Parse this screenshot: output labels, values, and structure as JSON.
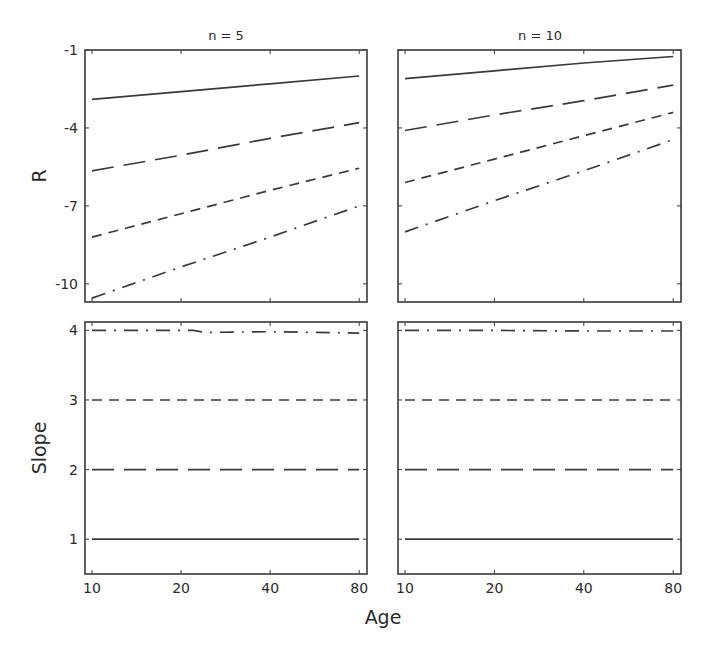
{
  "figure": {
    "xlabel": "Age",
    "row_labels": [
      "R",
      "Slope"
    ],
    "column_titles": [
      "n = 5",
      "n = 10"
    ]
  },
  "chart_data": [
    {
      "type": "line",
      "panel": "top-left",
      "title": "n = 5",
      "xlabel": "",
      "ylabel": "R",
      "x_scale": "log",
      "x": [
        10,
        20,
        40,
        80
      ],
      "xticks": [
        10,
        20,
        40,
        80
      ],
      "xlim": [
        9.47,
        85
      ],
      "yticks": [
        -1,
        -4,
        -7,
        -10
      ],
      "ylim": [
        -10.7,
        -1
      ],
      "grid": false,
      "series": [
        {
          "name": "slope 1",
          "style": "solid",
          "values": [
            -2.9,
            -2.6,
            -2.3,
            -2.0
          ]
        },
        {
          "name": "slope 2",
          "style": "long-dash",
          "values": [
            -5.65,
            -5.05,
            -4.4,
            -3.8
          ]
        },
        {
          "name": "slope 3",
          "style": "short-dash",
          "values": [
            -8.2,
            -7.3,
            -6.4,
            -5.55
          ]
        },
        {
          "name": "slope 4",
          "style": "dash-dot",
          "values": [
            -10.55,
            -9.35,
            -8.2,
            -7.0
          ]
        }
      ]
    },
    {
      "type": "line",
      "panel": "top-right",
      "title": "n = 10",
      "xlabel": "",
      "ylabel": "",
      "x_scale": "log",
      "x": [
        10,
        20,
        40,
        80
      ],
      "xticks": [
        10,
        20,
        40,
        80
      ],
      "xlim": [
        9.47,
        85
      ],
      "yticks": [
        -1,
        -4,
        -7,
        -10
      ],
      "ylim": [
        -10.7,
        -1
      ],
      "grid": false,
      "series": [
        {
          "name": "slope 1",
          "style": "solid",
          "values": [
            -2.1,
            -1.8,
            -1.5,
            -1.25
          ]
        },
        {
          "name": "slope 2",
          "style": "long-dash",
          "values": [
            -4.1,
            -3.5,
            -2.95,
            -2.35
          ]
        },
        {
          "name": "slope 3",
          "style": "short-dash",
          "values": [
            -6.1,
            -5.2,
            -4.3,
            -3.4
          ]
        },
        {
          "name": "slope 4",
          "style": "dash-dot",
          "values": [
            -8.0,
            -6.8,
            -5.65,
            -4.45
          ]
        }
      ]
    },
    {
      "type": "line",
      "panel": "bottom-left",
      "title": "",
      "xlabel": "Age",
      "ylabel": "Slope",
      "x_scale": "log",
      "x": [
        10,
        20,
        22,
        24,
        40,
        80
      ],
      "xticks": [
        10,
        20,
        40,
        80
      ],
      "xlim": [
        9.47,
        85
      ],
      "yticks": [
        1,
        2,
        3,
        4
      ],
      "ylim": [
        0.5,
        4.12
      ],
      "grid": false,
      "series": [
        {
          "name": "slope 1",
          "style": "solid",
          "values": [
            1.0,
            1.0,
            1.0,
            1.0,
            1.0,
            1.0
          ]
        },
        {
          "name": "slope 2",
          "style": "long-dash",
          "values": [
            2.0,
            2.0,
            2.0,
            2.0,
            2.0,
            2.0
          ]
        },
        {
          "name": "slope 3",
          "style": "short-dash",
          "values": [
            3.0,
            3.0,
            3.0,
            3.0,
            3.0,
            3.0
          ]
        },
        {
          "name": "slope 4",
          "style": "dash-dot",
          "values": [
            4.0,
            4.0,
            4.0,
            3.97,
            3.98,
            3.96
          ]
        }
      ]
    },
    {
      "type": "line",
      "panel": "bottom-right",
      "title": "",
      "xlabel": "Age",
      "ylabel": "",
      "x_scale": "log",
      "x": [
        10,
        20,
        40,
        80
      ],
      "xticks": [
        10,
        20,
        40,
        80
      ],
      "xlim": [
        9.47,
        85
      ],
      "yticks": [
        1,
        2,
        3,
        4
      ],
      "ylim": [
        0.5,
        4.12
      ],
      "grid": false,
      "series": [
        {
          "name": "slope 1",
          "style": "solid",
          "values": [
            1.0,
            1.0,
            1.0,
            1.0
          ]
        },
        {
          "name": "slope 2",
          "style": "long-dash",
          "values": [
            2.0,
            2.0,
            2.0,
            2.0
          ]
        },
        {
          "name": "slope 3",
          "style": "short-dash",
          "values": [
            3.0,
            3.0,
            3.0,
            3.0
          ]
        },
        {
          "name": "slope 4",
          "style": "dash-dot",
          "values": [
            4.0,
            4.0,
            3.99,
            3.99
          ]
        }
      ]
    }
  ],
  "line_styles": {
    "solid": "",
    "long-dash": "22 10",
    "short-dash": "10 7",
    "dash-dot": "14 8 2 8"
  },
  "colors": {
    "line": "#3a3a3a",
    "frame": "#3a3a3a",
    "text": "#2a2a2a",
    "background": "#ffffff"
  }
}
